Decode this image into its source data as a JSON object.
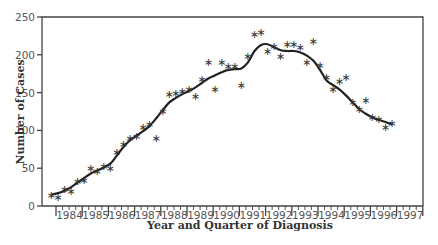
{
  "chart_data": {
    "type": "scatter",
    "title": "",
    "xlabel": "Year and Quarter of Diagnosis",
    "ylabel": "Number of Cases",
    "ylim": [
      0,
      250
    ],
    "yticks": [
      0,
      50,
      100,
      150,
      200,
      250
    ],
    "year_labels": [
      "1984",
      "1985",
      "1986",
      "1987",
      "1988",
      "1989",
      "1990",
      "1991",
      "1992",
      "1993",
      "1994",
      "1995",
      "1996",
      "1997"
    ],
    "grid": false,
    "legend": null,
    "marker": "star",
    "x_start": "1983 Q4",
    "series": [
      {
        "name": "Quarterly cases (observed)",
        "style": "star-markers",
        "values": [
          15,
          12,
          22,
          20,
          33,
          35,
          50,
          46,
          53,
          50,
          72,
          82,
          90,
          92,
          104,
          109,
          90,
          126,
          148,
          150,
          152,
          155,
          145,
          168,
          190,
          155,
          190,
          185,
          185,
          160,
          198,
          228,
          230,
          205,
          212,
          198,
          214,
          214,
          210,
          190,
          218,
          187,
          170,
          155,
          165,
          170,
          138,
          128,
          140,
          118,
          115,
          105,
          110
        ]
      },
      {
        "name": "Smoothed trend",
        "style": "line",
        "values": [
          15,
          17,
          20,
          25,
          31,
          37,
          43,
          47,
          51,
          56,
          67,
          78,
          87,
          93,
          99,
          106,
          116,
          127,
          137,
          143,
          148,
          152,
          157,
          163,
          169,
          173,
          177,
          180,
          181,
          182,
          190,
          205,
          213,
          214,
          210,
          206,
          205,
          205,
          203,
          199,
          192,
          180,
          166,
          160,
          154,
          146,
          137,
          128,
          122,
          117,
          114,
          111,
          108
        ]
      }
    ]
  }
}
